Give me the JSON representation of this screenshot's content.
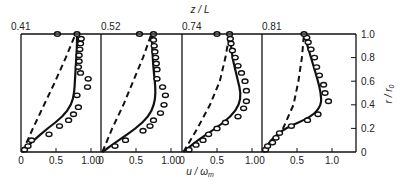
{
  "chart_data": {
    "type": "line",
    "title": "",
    "top_axis_label": "z / L",
    "xlabel": "u / ω_m",
    "ylabel": "r / r_0",
    "ylim": [
      0,
      1.0
    ],
    "y_ticks": [
      "0",
      "0.2",
      "0.4",
      "0.6",
      "0.8",
      "1.0"
    ],
    "grid": false,
    "legend": null,
    "panels": [
      {
        "z_over_L": "0.41",
        "x_ticks": [
          "0",
          "0.5",
          "1.00"
        ],
        "xlim": [
          0,
          1.1
        ],
        "solid_curve": {
          "r": [
            0,
            0.1,
            0.2,
            0.3,
            0.4,
            0.5,
            0.6,
            0.7,
            0.8,
            0.9,
            1.0
          ],
          "u": [
            0.02,
            0.18,
            0.38,
            0.6,
            0.72,
            0.76,
            0.77,
            0.78,
            0.79,
            0.8,
            0.8
          ]
        },
        "dashed_curve": {
          "r": [
            0,
            0.2,
            0.4,
            0.6,
            0.8,
            1.0
          ],
          "u": [
            0.02,
            0.17,
            0.33,
            0.49,
            0.64,
            0.78
          ]
        },
        "measured_points": {
          "r": [
            0.02,
            0.05,
            0.1,
            0.15,
            0.22,
            0.27,
            0.32,
            0.38,
            0.48,
            0.55,
            0.62,
            0.67,
            0.72,
            0.77,
            0.82,
            0.87,
            0.92,
            0.96,
            1.0,
            1.0
          ],
          "u": [
            0.05,
            0.1,
            0.15,
            0.4,
            0.55,
            0.68,
            0.75,
            0.82,
            0.8,
            0.95,
            0.96,
            0.85,
            0.82,
            0.83,
            0.83,
            0.84,
            0.85,
            0.86,
            0.52,
            0.8
          ]
        }
      },
      {
        "z_over_L": "0.52",
        "x_ticks": [
          "0",
          "0.5",
          "1.00"
        ],
        "xlim": [
          0,
          1.1
        ],
        "solid_curve": {
          "r": [
            0,
            0.1,
            0.2,
            0.3,
            0.4,
            0.5,
            0.6,
            0.7,
            0.8,
            0.9,
            1.0
          ],
          "u": [
            0.02,
            0.25,
            0.5,
            0.68,
            0.76,
            0.78,
            0.77,
            0.75,
            0.74,
            0.73,
            0.73
          ]
        },
        "dashed_curve": {
          "r": [
            0,
            0.2,
            0.4,
            0.6,
            0.8,
            1.0
          ],
          "u": [
            0.02,
            0.16,
            0.32,
            0.46,
            0.6,
            0.72
          ]
        },
        "measured_points": {
          "r": [
            0.05,
            0.1,
            0.18,
            0.22,
            0.27,
            0.33,
            0.4,
            0.48,
            0.55,
            0.62,
            0.7,
            0.75,
            0.8,
            0.85,
            0.9,
            0.95,
            1.0,
            1.0
          ],
          "u": [
            0.2,
            0.35,
            0.6,
            0.7,
            0.75,
            0.85,
            0.9,
            0.92,
            0.88,
            0.8,
            0.8,
            0.79,
            0.78,
            0.77,
            0.76,
            0.75,
            0.55,
            0.75
          ]
        }
      },
      {
        "z_over_L": "0.74",
        "x_ticks": [
          "0",
          "0.5",
          "1.0"
        ],
        "xlim": [
          0,
          1.1
        ],
        "solid_curve": {
          "r": [
            0,
            0.1,
            0.2,
            0.3,
            0.4,
            0.5,
            0.6,
            0.7,
            0.8,
            0.9,
            1.0
          ],
          "u": [
            0.02,
            0.22,
            0.48,
            0.7,
            0.82,
            0.84,
            0.8,
            0.76,
            0.72,
            0.7,
            0.68
          ]
        },
        "dashed_curve": {
          "r": [
            0,
            0.2,
            0.4,
            0.6,
            0.8,
            1.0
          ],
          "u": [
            0.02,
            0.22,
            0.4,
            0.54,
            0.62,
            0.68
          ]
        },
        "measured_points": {
          "r": [
            0.02,
            0.06,
            0.1,
            0.15,
            0.2,
            0.25,
            0.3,
            0.37,
            0.43,
            0.52,
            0.6,
            0.67,
            0.73,
            0.8,
            0.86,
            0.92,
            0.96,
            1.0,
            1.0
          ],
          "u": [
            0.1,
            0.2,
            0.3,
            0.38,
            0.5,
            0.62,
            0.8,
            0.88,
            0.92,
            0.92,
            0.9,
            0.85,
            0.8,
            0.76,
            0.72,
            0.7,
            0.69,
            0.5,
            0.68
          ]
        }
      },
      {
        "z_over_L": "0.81",
        "x_ticks": [
          "0",
          "0.5",
          "1.0"
        ],
        "xlim": [
          0,
          1.25
        ],
        "solid_curve": {
          "r": [
            0,
            0.1,
            0.2,
            0.3,
            0.4,
            0.5,
            0.6,
            0.7,
            0.8,
            0.9,
            1.0
          ],
          "u": [
            0.02,
            0.12,
            0.32,
            0.72,
            0.85,
            0.84,
            0.8,
            0.75,
            0.7,
            0.65,
            0.6
          ]
        },
        "dashed_curve": {
          "r": [
            0,
            0.2,
            0.4,
            0.6,
            0.8,
            1.0
          ],
          "u": [
            0.02,
            0.3,
            0.45,
            0.52,
            0.57,
            0.6
          ]
        },
        "measured_points": {
          "r": [
            0.02,
            0.05,
            0.08,
            0.12,
            0.16,
            0.22,
            0.27,
            0.32,
            0.43,
            0.5,
            0.57,
            0.65,
            0.72,
            0.8,
            0.87,
            0.93,
            0.97,
            1.0
          ],
          "u": [
            0.05,
            0.08,
            0.15,
            0.2,
            0.25,
            0.42,
            0.65,
            0.8,
            0.95,
            0.9,
            0.88,
            0.82,
            0.78,
            0.75,
            0.7,
            0.66,
            0.64,
            0.6
          ]
        }
      }
    ]
  }
}
